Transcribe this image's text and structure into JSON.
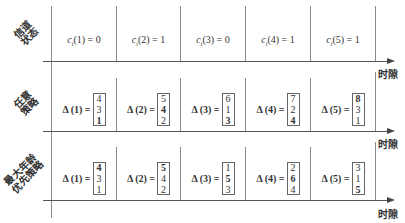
{
  "axis_label": "时隙",
  "rows": [
    {
      "label_lines": [
        "信道",
        "状态"
      ],
      "type": "channel",
      "cells": [
        {
          "sub": "t",
          "index": "1",
          "value": "0"
        },
        {
          "sub": "t",
          "index": "2",
          "value": "1"
        },
        {
          "sub": "t",
          "index": "3",
          "value": "0"
        },
        {
          "sub": "t",
          "index": "4",
          "value": "1"
        },
        {
          "sub": "t",
          "index": "5",
          "value": "1"
        }
      ]
    },
    {
      "label_lines": [
        "任意",
        "策略"
      ],
      "type": "matrix",
      "cells": [
        {
          "lhs": "Δ (1) =",
          "values": [
            "4",
            "3",
            "1"
          ],
          "bold": [
            false,
            false,
            true
          ]
        },
        {
          "lhs": "Δ (2) =",
          "values": [
            "5",
            "4",
            "2"
          ],
          "bold": [
            false,
            true,
            false
          ]
        },
        {
          "lhs": "Δ (3) =",
          "values": [
            "6",
            "1",
            "3"
          ],
          "bold": [
            false,
            false,
            true
          ]
        },
        {
          "lhs": "Δ (4) =",
          "values": [
            "7",
            "2",
            "4"
          ],
          "bold": [
            false,
            false,
            true
          ]
        },
        {
          "lhs": "Δ (5) =",
          "values": [
            "8",
            "3",
            "1"
          ],
          "bold": [
            true,
            false,
            false
          ]
        }
      ]
    },
    {
      "label_lines": [
        "最大年龄",
        "优先策略"
      ],
      "type": "matrix",
      "cells": [
        {
          "lhs": "Δ (1) =",
          "values": [
            "4",
            "3",
            "1"
          ],
          "bold": [
            true,
            false,
            false
          ]
        },
        {
          "lhs": "Δ (2) =",
          "values": [
            "5",
            "4",
            "2"
          ],
          "bold": [
            true,
            false,
            false
          ]
        },
        {
          "lhs": "Δ (3) =",
          "values": [
            "1",
            "5",
            "3"
          ],
          "bold": [
            false,
            true,
            false
          ]
        },
        {
          "lhs": "Δ (4) =",
          "values": [
            "2",
            "6",
            "4"
          ],
          "bold": [
            false,
            true,
            false
          ]
        },
        {
          "lhs": "Δ (5) =",
          "values": [
            "3",
            "1",
            "5"
          ],
          "bold": [
            false,
            false,
            true
          ]
        }
      ]
    }
  ]
}
